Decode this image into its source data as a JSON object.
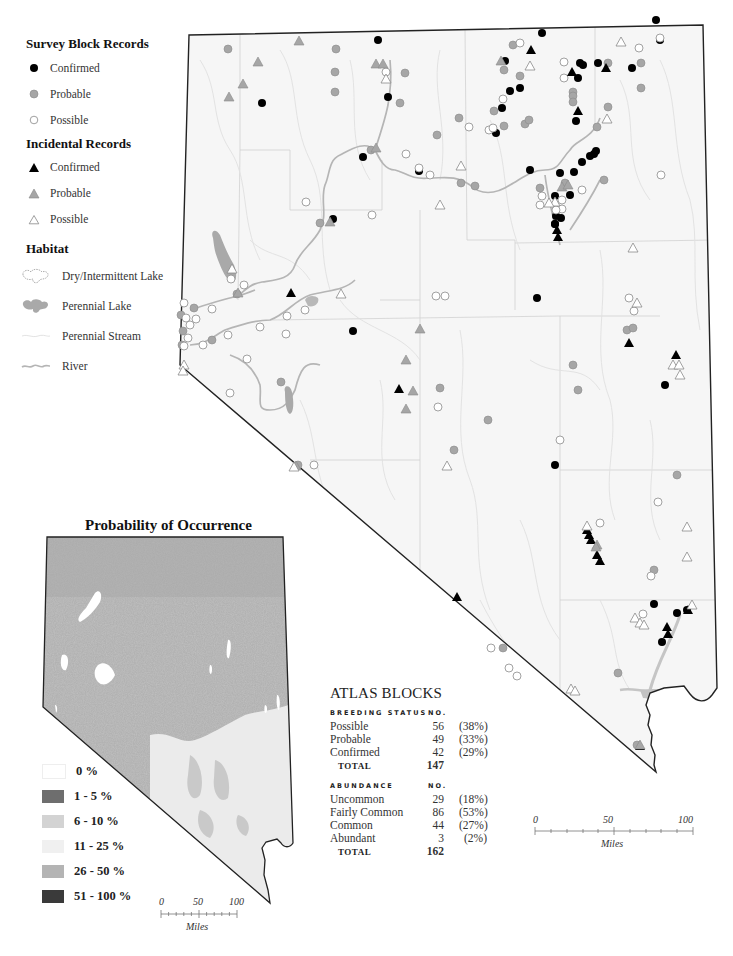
{
  "legend": {
    "survey_title": "Survey Block Records",
    "survey_items": [
      {
        "label": "Confirmed",
        "symbol": "filled-circle-black"
      },
      {
        "label": "Probable",
        "symbol": "filled-circle-gray"
      },
      {
        "label": "Possible",
        "symbol": "open-circle"
      }
    ],
    "incidental_title": "Incidental Records",
    "incidental_items": [
      {
        "label": "Confirmed",
        "symbol": "filled-triangle-black"
      },
      {
        "label": "Probable",
        "symbol": "filled-triangle-gray"
      },
      {
        "label": "Possible",
        "symbol": "open-triangle"
      }
    ],
    "habitat_title": "Habitat",
    "habitat_items": [
      {
        "label": "Dry/Intermittent Lake",
        "symbol": "dry-lake-outline"
      },
      {
        "label": "Perennial Lake",
        "symbol": "perennial-lake-fill"
      },
      {
        "label": "Perennial Stream",
        "symbol": "stream-line"
      },
      {
        "label": "River",
        "symbol": "river-line"
      }
    ]
  },
  "probability_map": {
    "title": "Probability of Occurrence",
    "legend": [
      {
        "label": "0 %",
        "color": "#ffffff"
      },
      {
        "label": "1 - 5 %",
        "color": "#6e6e6e"
      },
      {
        "label": "6 - 10 %",
        "color": "#d3d3d3"
      },
      {
        "label": "11 - 25 %",
        "color": "#f0f0f0"
      },
      {
        "label": "26 - 50 %",
        "color": "#b4b4b4"
      },
      {
        "label": "51 - 100 %",
        "color": "#3a3a3a"
      }
    ],
    "scale": {
      "ticks": [
        "0",
        "50",
        "100"
      ],
      "unit": "Miles"
    }
  },
  "atlas_blocks": {
    "title": "ATLAS BLOCKS",
    "breeding": {
      "header": "BREEDING STATUS",
      "no_header": "NO.",
      "rows": [
        {
          "label": "Possible",
          "no": "56",
          "pct": "(38%)"
        },
        {
          "label": "Probable",
          "no": "49",
          "pct": "(33%)"
        },
        {
          "label": "Confirmed",
          "no": "42",
          "pct": "(29%)"
        }
      ],
      "total_label": "TOTAL",
      "total": "147"
    },
    "abundance": {
      "header": "ABUNDANCE",
      "no_header": "NO.",
      "rows": [
        {
          "label": "Uncommon",
          "no": "29",
          "pct": "(18%)"
        },
        {
          "label": "Fairly Common",
          "no": "86",
          "pct": "(53%)"
        },
        {
          "label": "Common",
          "no": "44",
          "pct": "(27%)"
        },
        {
          "label": "Abundant",
          "no": "3",
          "pct": "(2%)"
        }
      ],
      "total_label": "TOTAL",
      "total": "162"
    }
  },
  "main_map": {
    "scale": {
      "ticks": [
        "0",
        "50",
        "100"
      ],
      "unit": "Miles"
    },
    "colors": {
      "confirmed": "#000000",
      "probable": "#a6a6a6",
      "possible": "#ffffff",
      "outline": "#222222",
      "river": "#b5b5b5",
      "lake": "#a9a9a9"
    }
  }
}
